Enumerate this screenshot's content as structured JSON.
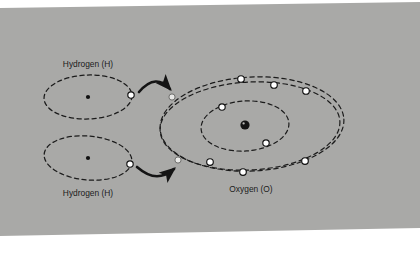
{
  "figure": {
    "kind": "atomic-bonding-diagram",
    "background_color": "#a9a9a7",
    "panel_margin_color": "#ffffff",
    "ink_color": "#1b1b1b",
    "electron_fill": "#ffffff",
    "electron_stroke": "#101010",
    "nucleus_color": "#101010",
    "shared_electron_fill": "#e8e8e6"
  },
  "labels": {
    "hydrogen_top": "Hydrogen (H)",
    "hydrogen_bottom": "Hydrogen (H)",
    "oxygen": "Oxygen (O)"
  },
  "atoms": {
    "hydrogen_top": {
      "name": "Hydrogen (H)",
      "nucleus": {
        "cx": 88,
        "cy": 97
      },
      "shells": [
        {
          "cx": 88,
          "cy": 97,
          "rx": 44,
          "ry": 22
        }
      ],
      "electrons": [
        {
          "cx": 131,
          "cy": 95
        }
      ],
      "electron_count": 1,
      "label_pos": {
        "x": 88,
        "y": 67
      }
    },
    "hydrogen_bottom": {
      "name": "Hydrogen (H)",
      "nucleus": {
        "cx": 88,
        "cy": 158
      },
      "shells": [
        {
          "cx": 88,
          "cy": 158,
          "rx": 44,
          "ry": 22
        }
      ],
      "electrons": [
        {
          "cx": 130,
          "cy": 164
        }
      ],
      "electron_count": 1,
      "label_pos": {
        "x": 88,
        "y": 196
      }
    },
    "oxygen": {
      "name": "Oxygen (O)",
      "nucleus": {
        "cx": 245,
        "cy": 125,
        "r": 4.6
      },
      "shells": [
        {
          "role": "inner",
          "cx": 245,
          "cy": 126,
          "rx": 44,
          "ry": 25,
          "rot": -4
        },
        {
          "role": "outer-a",
          "cx": 252,
          "cy": 124,
          "rx": 92,
          "ry": 47,
          "rot": -3
        },
        {
          "role": "outer-b",
          "cx": 250,
          "cy": 126,
          "rx": 90,
          "ry": 44,
          "rot": -3
        }
      ],
      "inner_electrons": [
        {
          "cx": 222,
          "cy": 107
        },
        {
          "cx": 266,
          "cy": 143
        }
      ],
      "outer_electrons": [
        {
          "cx": 241,
          "cy": 79
        },
        {
          "cx": 274,
          "cy": 85
        },
        {
          "cx": 306,
          "cy": 91
        },
        {
          "cx": 210,
          "cy": 162
        },
        {
          "cx": 243,
          "cy": 172
        },
        {
          "cx": 305,
          "cy": 161
        }
      ],
      "shared_electrons": [
        {
          "cx": 172,
          "cy": 97,
          "from": "hydrogen_top"
        },
        {
          "cx": 178,
          "cy": 160,
          "from": "hydrogen_bottom"
        }
      ],
      "inner_electron_count": 2,
      "outer_electron_count": 6,
      "shared_electron_count": 2,
      "label_pos": {
        "x": 251,
        "y": 192
      }
    }
  },
  "arrows": [
    {
      "name": "arrow-top",
      "label": "electron transfer from top hydrogen",
      "path": "M139,92 C152,78 162,80 172,90",
      "tip": {
        "x": 172,
        "y": 90
      }
    },
    {
      "name": "arrow-bottom",
      "label": "electron transfer from bottom hydrogen",
      "path": "M137,167 C152,180 164,178 176,168",
      "tip": {
        "x": 176,
        "y": 168
      }
    }
  ]
}
